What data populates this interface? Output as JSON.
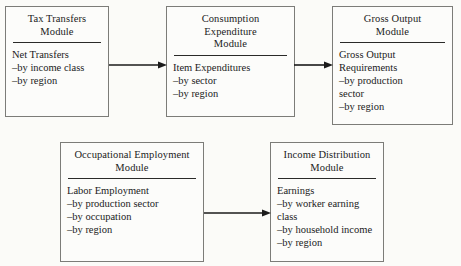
{
  "diagram": {
    "background_color": "#fbfbf8",
    "box_border_color": "#7c7c78",
    "arrow_color": "#1b1b1b",
    "modules": [
      {
        "id": "tax-transfers",
        "title": "Tax Transfers\nModule",
        "head": "Net Transfers",
        "items": [
          "–by income class",
          "–by region"
        ]
      },
      {
        "id": "consumption",
        "title": "Consumption\nExpenditure\nModule",
        "head": "Item Expenditures",
        "items": [
          "–by sector",
          "–by region"
        ]
      },
      {
        "id": "gross-output",
        "title": "Gross Output\nModule",
        "head": "Gross Output\n   Requirements",
        "items": [
          "–by production\n  sector",
          "–by region"
        ]
      },
      {
        "id": "occupational",
        "title": "Occupational Employment\nModule",
        "head": "Labor Employment",
        "items": [
          "–by production sector",
          "–by occupation",
          "–by region"
        ]
      },
      {
        "id": "income-distribution",
        "title": "Income Distribution\nModule",
        "head": "Earnings",
        "items": [
          "–by worker earning\n class",
          "–by household income",
          "–by region"
        ]
      }
    ],
    "arrows": [
      {
        "id": "tax-to-consumption",
        "from": "tax-transfers",
        "to": "consumption",
        "direction": "right"
      },
      {
        "id": "consumption-to-gross",
        "from": "consumption",
        "to": "gross-output",
        "direction": "right"
      },
      {
        "id": "occupational-to-income",
        "from": "occupational",
        "to": "income-distribution",
        "direction": "right"
      }
    ]
  }
}
